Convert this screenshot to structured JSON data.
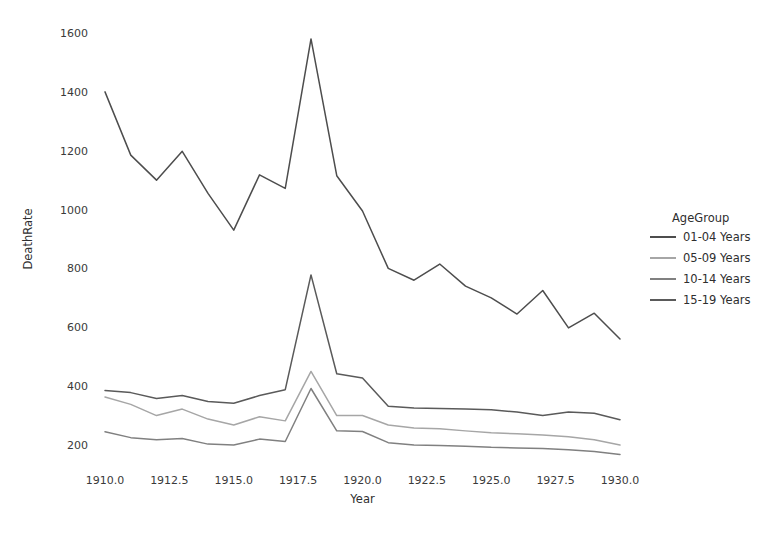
{
  "chart_data": {
    "type": "line",
    "title": "",
    "xlabel": "Year",
    "ylabel": "DeathRate",
    "xlim": [
      1909.2,
      1930.4
    ],
    "ylim": [
      118,
      1660
    ],
    "grid": false,
    "legend_position": "right",
    "legend_title": "AgeGroup",
    "xticks": [
      "1910.0",
      "1912.5",
      "1915.0",
      "1917.5",
      "1920.0",
      "1922.5",
      "1925.0",
      "1927.5",
      "1930.0"
    ],
    "xtick_values": [
      1910,
      1912.5,
      1915,
      1917.5,
      1920,
      1922.5,
      1925,
      1927.5,
      1930
    ],
    "yticks": [
      "200",
      "400",
      "600",
      "800",
      "1000",
      "1200",
      "1400",
      "1600"
    ],
    "ytick_values": [
      200,
      400,
      600,
      800,
      1000,
      1200,
      1400,
      1600
    ],
    "x": [
      1910,
      1911,
      1912,
      1913,
      1914,
      1915,
      1916,
      1917,
      1918,
      1919,
      1920,
      1921,
      1922,
      1923,
      1924,
      1925,
      1926,
      1927,
      1928,
      1929,
      1930
    ],
    "series": [
      {
        "name": "01-04 Years",
        "color": "#4d4d4d",
        "values": [
          1400,
          1185,
          1100,
          1198,
          1055,
          930,
          1118,
          1072,
          1580,
          1115,
          995,
          800,
          760,
          815,
          740,
          700,
          645,
          725,
          598,
          648,
          560
        ]
      },
      {
        "name": "05-09 Years",
        "color": "#a6a6a6",
        "values": [
          363,
          338,
          300,
          322,
          288,
          268,
          296,
          282,
          450,
          300,
          300,
          268,
          258,
          255,
          248,
          242,
          238,
          234,
          228,
          218,
          200
        ]
      },
      {
        "name": "10-14 Years",
        "color": "#808080",
        "values": [
          245,
          225,
          218,
          222,
          203,
          200,
          220,
          212,
          392,
          248,
          246,
          208,
          200,
          198,
          196,
          192,
          190,
          188,
          184,
          178,
          168
        ]
      },
      {
        "name": "15-19 Years",
        "color": "#5a5a5a",
        "values": [
          385,
          378,
          358,
          368,
          348,
          342,
          368,
          388,
          778,
          442,
          428,
          332,
          326,
          324,
          322,
          320,
          312,
          300,
          312,
          308,
          286
        ]
      }
    ]
  },
  "legend": {
    "title": "AgeGroup",
    "items": [
      {
        "label": "01-04 Years",
        "color": "#4d4d4d"
      },
      {
        "label": "05-09 Years",
        "color": "#a6a6a6"
      },
      {
        "label": "10-14 Years",
        "color": "#808080"
      },
      {
        "label": "15-19 Years",
        "color": "#5a5a5a"
      }
    ]
  },
  "axes": {
    "x_title": "Year",
    "y_title": "DeathRate"
  }
}
